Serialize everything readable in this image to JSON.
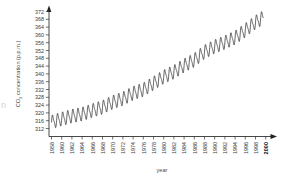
{
  "chart_data": {
    "type": "line",
    "title": "",
    "xlabel": "year",
    "ylabel": "CO2 concentration (p.p.m.)",
    "ylabel_parts": {
      "species": "CO",
      "subscript": "2",
      "rest": " concentration (p.p.m.)"
    },
    "xlim": [
      1958,
      2001
    ],
    "ylim": [
      310,
      374
    ],
    "grid": false,
    "legend": null,
    "xticks": [
      1958,
      1960,
      1962,
      1964,
      1966,
      1968,
      1970,
      1972,
      1974,
      1976,
      1978,
      1980,
      1982,
      1984,
      1986,
      1988,
      1990,
      1992,
      1994,
      1996,
      1998,
      2000
    ],
    "xtick_labels": [
      "1958",
      "1960",
      "1962",
      "1964",
      "1966",
      "1968",
      "1970",
      "1972",
      "1974",
      "1976",
      "1978",
      "1980",
      "1982",
      "1984",
      "1986",
      "1988",
      "1990",
      "1992",
      "1994",
      "1996",
      "1998",
      "2000"
    ],
    "yticks": [
      312,
      316,
      320,
      324,
      328,
      332,
      336,
      340,
      344,
      348,
      352,
      356,
      360,
      364,
      368,
      372
    ],
    "ytick_labels": [
      "312",
      "316",
      "320",
      "324",
      "328",
      "332",
      "336",
      "340",
      "344",
      "348",
      "352",
      "356",
      "360",
      "364",
      "368",
      "372"
    ],
    "series": [
      {
        "name": "Mauna Loa monthly mean CO2",
        "annual_trend_x": [
          1958,
          1960,
          1962,
          1964,
          1966,
          1968,
          1970,
          1972,
          1974,
          1976,
          1978,
          1980,
          1982,
          1984,
          1986,
          1988,
          1990,
          1992,
          1994,
          1996,
          1998,
          1999.5
        ],
        "annual_trend_y": [
          315.3,
          316.9,
          318.4,
          319.4,
          321.2,
          322.9,
          325.5,
          327.3,
          330.1,
          331.9,
          335.2,
          338.5,
          341.0,
          344.3,
          347.1,
          351.3,
          354.0,
          356.2,
          358.6,
          362.4,
          366.5,
          368.9
        ],
        "seasonal_amplitude_ppm": 3.1,
        "seasonal_period_years": 1.0,
        "color": "#222222",
        "linewidth": 0.7,
        "start_value": 315.3,
        "end_value": 368.9,
        "n_cycles": 42
      }
    ],
    "axis_style": {
      "arrowheads": true,
      "spine_color": "#333333",
      "background": "#ffffff",
      "tick_direction": "out"
    }
  },
  "edge_artifact": {
    "text": "n"
  }
}
